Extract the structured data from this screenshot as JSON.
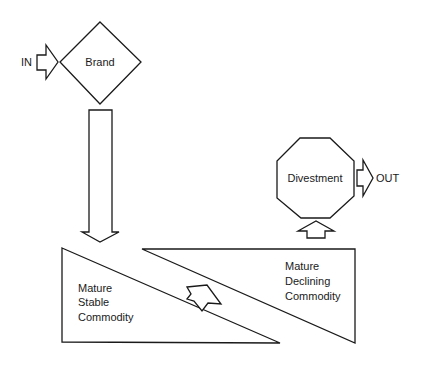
{
  "diagram": {
    "nodes": {
      "brand": {
        "label": "Brand",
        "shape": "diamond"
      },
      "divestment": {
        "label": "Divestment",
        "shape": "octagon"
      },
      "mature_stable": {
        "lines": [
          "Mature",
          "Stable",
          "Commodity"
        ],
        "shape": "right-triangle"
      },
      "mature_declining": {
        "lines": [
          "Mature",
          "Declining",
          "Commodity"
        ],
        "shape": "right-triangle"
      }
    },
    "flows": {
      "in_label": "IN",
      "out_label": "OUT"
    },
    "edges": [
      {
        "from": "IN",
        "to": "brand",
        "type": "block-arrow-right"
      },
      {
        "from": "brand",
        "to": "mature_stable",
        "type": "block-arrow-down"
      },
      {
        "from": "mature_stable",
        "to": "mature_declining",
        "type": "block-arrow-diagonal"
      },
      {
        "from": "mature_declining",
        "to": "divestment",
        "type": "block-arrow-up"
      },
      {
        "from": "divestment",
        "to": "OUT",
        "type": "block-arrow-right"
      }
    ],
    "colors": {
      "stroke": "#1a1a1a",
      "fill": "#ffffff",
      "background": "#ffffff"
    }
  }
}
